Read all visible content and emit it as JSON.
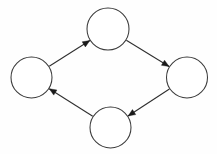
{
  "figure": {
    "kind": "directed-cycle-graph",
    "title": "",
    "background_color": "#fefefe",
    "stroke_color": "#2e2e2e",
    "node_fill_color": "#ffffff",
    "node_stroke_color": "#3b3b3b",
    "arrow_color": "#1a1a1a",
    "width": 217,
    "height": 154
  },
  "nodes": [
    {
      "id": "top",
      "label": "",
      "cx": 108,
      "cy": 29,
      "r": 21
    },
    {
      "id": "right",
      "label": "",
      "cx": 187,
      "cy": 77.5,
      "r": 20.5
    },
    {
      "id": "bottom",
      "label": "",
      "cx": 110.5,
      "cy": 127.5,
      "r": 20.5
    },
    {
      "id": "left",
      "label": "",
      "cx": 31.5,
      "cy": 77.5,
      "r": 20.5
    }
  ],
  "edges": [
    {
      "id": "e1",
      "from": "left",
      "to": "top",
      "directed": true,
      "arrow_at": "top"
    },
    {
      "id": "e2",
      "from": "top",
      "to": "right",
      "directed": true,
      "arrow_at": "right"
    },
    {
      "id": "e3",
      "from": "right",
      "to": "bottom",
      "directed": true,
      "arrow_at": "bottom"
    },
    {
      "id": "e4",
      "from": "bottom",
      "to": "left",
      "directed": true,
      "arrow_at": "left"
    }
  ]
}
